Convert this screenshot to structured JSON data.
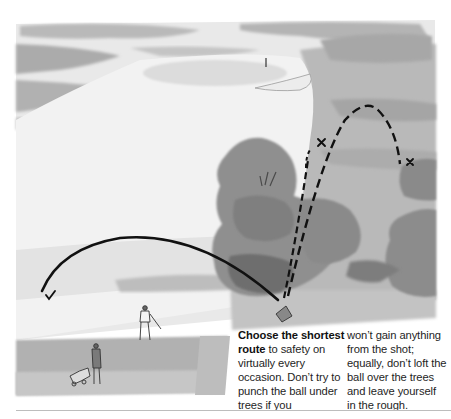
{
  "illustration": {
    "subject": "golf-shot-route-over-trees",
    "marks": {
      "check_mark": "✓",
      "cross_mark_left": "✕",
      "cross_mark_right": "✕"
    },
    "colors": {
      "sky_light": "#efefef",
      "wash_mid": "#c8c8c8",
      "wash_dark": "#a9a9a9",
      "tree": "#8e8e8e",
      "tree_dark": "#6f6f6f",
      "trajectory": "#111111"
    }
  },
  "caption": {
    "bold_lead": "Choose the shortest route",
    "col1_rest": " to safety on virtually every occasion. Don’t try to punch the ball under trees if you",
    "col2": "won’t gain anything from the shot; equally, don’t loft the ball over the trees and leave yourself in the rough."
  }
}
